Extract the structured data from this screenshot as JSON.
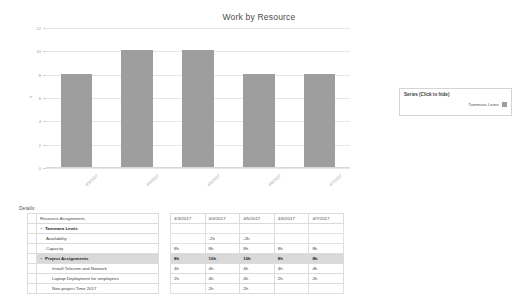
{
  "chart": {
    "title": "Work by Resource",
    "y_axis_title": "h"
  },
  "legend": {
    "title": "Series (Click to hide)",
    "entries": [
      {
        "label": "Tammara Lewis",
        "color": "#9e9e9e"
      }
    ]
  },
  "details": {
    "label": "Details:",
    "name_header": "Resource Assignments",
    "date_headers": [
      "4/3/2017",
      "4/4/2017",
      "4/5/2017",
      "4/6/2017",
      "4/7/2017"
    ],
    "rows": [
      {
        "name": "Tammara Lewis",
        "indent": 0,
        "expander": "−",
        "bold": true,
        "highlight": false,
        "values": [
          "",
          "",
          "",
          "",
          ""
        ]
      },
      {
        "name": "Availability",
        "indent": 1,
        "expander": "",
        "bold": false,
        "highlight": false,
        "values": [
          "",
          "-2h",
          "-2h",
          "",
          ""
        ]
      },
      {
        "name": "Capacity",
        "indent": 1,
        "expander": "",
        "bold": false,
        "highlight": false,
        "values": [
          "8h",
          "8h",
          "8h",
          "8h",
          "8h"
        ]
      },
      {
        "name": "Project Assignments",
        "indent": 0,
        "expander": "−",
        "bold": true,
        "highlight": true,
        "values": [
          "8h",
          "10h",
          "10h",
          "8h",
          "8h"
        ]
      },
      {
        "name": "Install Telecom and Network",
        "indent": 2,
        "expander": "",
        "bold": false,
        "highlight": false,
        "values": [
          "4h",
          "4h",
          "4h",
          "4h",
          "4h"
        ]
      },
      {
        "name": "Laptop Deployment for employees",
        "indent": 2,
        "expander": "",
        "bold": false,
        "highlight": false,
        "values": [
          "2h",
          "4h",
          "4h",
          "2h",
          "2h"
        ]
      },
      {
        "name": "Non-project Time 2017",
        "indent": 2,
        "expander": "",
        "bold": false,
        "highlight": false,
        "values": [
          "",
          "2h",
          "2h",
          "",
          ""
        ]
      }
    ]
  },
  "chart_data": {
    "type": "bar",
    "title": "Work by Resource",
    "xlabel": "",
    "ylabel": "h",
    "categories": [
      "4/3/2017",
      "4/4/2017",
      "4/5/2017",
      "4/6/2017",
      "4/7/2017"
    ],
    "series": [
      {
        "name": "Tammara Lewis",
        "values": [
          8,
          10,
          10,
          8,
          8
        ],
        "color": "#9e9e9e"
      }
    ],
    "ylim": [
      0,
      12
    ],
    "yticks": [
      0,
      2,
      4,
      6,
      8,
      10,
      12
    ],
    "grid": true,
    "legend_position": "right"
  }
}
